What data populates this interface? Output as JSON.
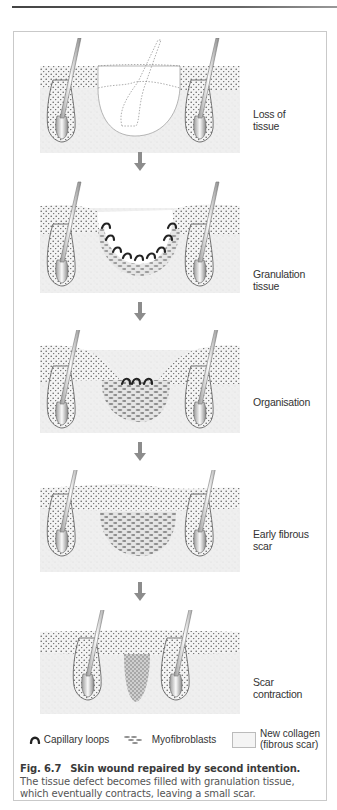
{
  "figure": {
    "number": "Fig. 6.7",
    "title": "Skin wound repaired by second intention.",
    "description": "The tissue defect becomes filled with granulation tissue, which eventually contracts, leaving a small scar."
  },
  "stages": [
    {
      "label_line1": "Loss of",
      "label_line2": "tissue"
    },
    {
      "label_line1": "Granulation",
      "label_line2": "tissue"
    },
    {
      "label_line1": "Organisation",
      "label_line2": ""
    },
    {
      "label_line1": "Early fibrous",
      "label_line2": "scar"
    },
    {
      "label_line1": "Scar",
      "label_line2": "contraction"
    }
  ],
  "legend": {
    "capillary": "Capillary loops",
    "myofibroblasts": "Myofibroblasts",
    "collagen_line1": "New collagen",
    "collagen_line2": "(fibrous scar)"
  },
  "colors": {
    "epidermis_dots": "#5a5a5a",
    "dermis": "#ececec",
    "capillary": "#222222",
    "myofibroblast": "#8a8a8a",
    "arrow": "#8c8c8c",
    "frame": "#c9c9c9"
  }
}
